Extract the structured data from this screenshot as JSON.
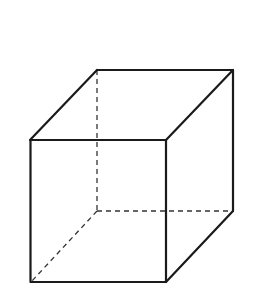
{
  "diagram": {
    "type": "cube-wireframe",
    "colors": {
      "edge": "#1a1a1a",
      "hidden_edge": "#333333",
      "background": "#ffffff"
    },
    "vertices": {
      "front_top_left": [
        30,
        140
      ],
      "front_top_right": [
        166,
        140
      ],
      "front_bottom_left": [
        31,
        282
      ],
      "front_bottom_right": [
        166,
        282
      ],
      "back_top_left": [
        97,
        70
      ],
      "back_top_right": [
        233,
        70
      ],
      "back_bottom_left": [
        97,
        211
      ],
      "back_bottom_right": [
        233,
        211
      ]
    },
    "visible_edge_count": 9,
    "hidden_edge_count": 3
  }
}
